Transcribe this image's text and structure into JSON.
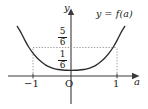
{
  "figure": {
    "name": "graph-of-function",
    "background_color": "#ffffff",
    "ink_color": "#1a1a1a",
    "curve_color": "#2b2b2b",
    "guide_color": "#9a9a9a"
  },
  "labels": {
    "y_axis": "y",
    "x_axis": "a",
    "curve": "y = f(a)",
    "origin": "O"
  },
  "x_ticks": [
    {
      "label": "−1",
      "value": -1
    },
    {
      "label": "O",
      "value": 0
    },
    {
      "label": "1",
      "value": 1
    }
  ],
  "y_ticks": [
    {
      "numerator": "5",
      "denominator": "6",
      "value": 0.8333
    },
    {
      "numerator": "1",
      "denominator": "6",
      "value": 0.1667
    }
  ],
  "chart_data": {
    "type": "line",
    "title": "",
    "xlabel": "a",
    "ylabel": "y",
    "grid": false,
    "legend": null,
    "annotations": [
      "y = f(a)"
    ],
    "xlim": [
      -1.45,
      1.45
    ],
    "ylim": [
      -0.35,
      1.55
    ],
    "x_tick_labels": [
      "−1",
      "O",
      "1"
    ],
    "x_tick_values": [
      -1,
      0,
      1
    ],
    "y_tick_labels": [
      "5/6",
      "1/6"
    ],
    "y_tick_values": [
      0.8333,
      0.1667
    ],
    "guide_lines": [
      {
        "orientation": "horizontal",
        "value": 0.8333,
        "style": "dotted",
        "from_x": -1,
        "to_x": 1
      },
      {
        "orientation": "vertical",
        "value": -1,
        "style": "dotted",
        "from_y": 0,
        "to_y": 0.8333
      },
      {
        "orientation": "vertical",
        "value": 1,
        "style": "dotted",
        "from_y": 0,
        "to_y": 0.8333
      }
    ],
    "series": [
      {
        "name": "y = f(a)",
        "description": "U-shaped convex curve, symmetric about the y-axis, minimum 1/6 at a = 0, passing through (−1, 5/6) and (1, 5/6)",
        "x": [
          -1.28,
          -1.2,
          -1.1,
          -1.0,
          -0.9,
          -0.8,
          -0.7,
          -0.6,
          -0.5,
          -0.4,
          -0.3,
          -0.2,
          -0.1,
          0.0,
          0.1,
          0.2,
          0.3,
          0.4,
          0.5,
          0.6,
          0.7,
          0.8,
          0.9,
          1.0,
          1.1,
          1.2,
          1.28
        ],
        "y": [
          1.45,
          1.29,
          1.05,
          0.8333,
          0.66,
          0.52,
          0.41,
          0.32,
          0.26,
          0.215,
          0.19,
          0.175,
          0.168,
          0.1667,
          0.168,
          0.175,
          0.19,
          0.215,
          0.26,
          0.32,
          0.41,
          0.52,
          0.66,
          0.8333,
          1.05,
          1.29,
          1.45
        ]
      }
    ]
  }
}
